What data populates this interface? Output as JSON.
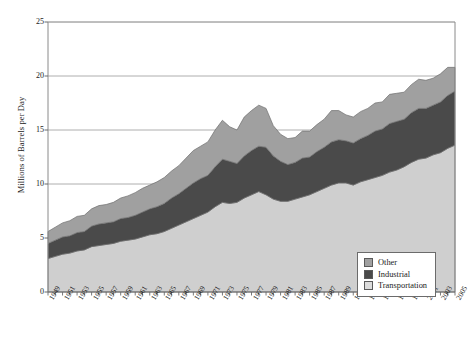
{
  "chart_data": {
    "type": "area",
    "stacked": true,
    "title": "",
    "xlabel": "",
    "ylabel": "Millions of Barrels per Day",
    "ylim": [
      0,
      25
    ],
    "yticks": [
      0,
      5,
      10,
      15,
      20,
      25
    ],
    "xlim": [
      1949,
      2005
    ],
    "grid": true,
    "legend_position": "bottom-right",
    "legend_entries": [
      "Other",
      "Industrial",
      "Transportation"
    ],
    "x": [
      1949,
      1950,
      1951,
      1952,
      1953,
      1954,
      1955,
      1956,
      1957,
      1958,
      1959,
      1960,
      1961,
      1962,
      1963,
      1964,
      1965,
      1966,
      1967,
      1968,
      1969,
      1970,
      1971,
      1972,
      1973,
      1974,
      1975,
      1976,
      1977,
      1978,
      1979,
      1980,
      1981,
      1982,
      1983,
      1984,
      1985,
      1986,
      1987,
      1988,
      1989,
      1990,
      1991,
      1992,
      1993,
      1994,
      1995,
      1996,
      1997,
      1998,
      1999,
      2000,
      2001,
      2002,
      2003,
      2004,
      2005
    ],
    "xtick_labels": [
      "1949",
      "1951",
      "1953",
      "1955",
      "1957",
      "1959",
      "1961",
      "1963",
      "1965",
      "1967",
      "1969",
      "1971",
      "1973",
      "1975",
      "1977",
      "1979",
      "1981",
      "1983",
      "1985",
      "1987",
      "1989",
      "1991",
      "1993",
      "1995",
      "1997",
      "1999",
      "2001",
      "2003",
      "2005"
    ],
    "series": [
      {
        "name": "Transportation",
        "color": "#cfcfcf",
        "values": [
          3.1,
          3.3,
          3.5,
          3.6,
          3.8,
          3.9,
          4.2,
          4.3,
          4.4,
          4.5,
          4.7,
          4.8,
          4.9,
          5.1,
          5.3,
          5.4,
          5.6,
          5.9,
          6.2,
          6.5,
          6.8,
          7.1,
          7.4,
          7.9,
          8.3,
          8.2,
          8.3,
          8.7,
          9.0,
          9.3,
          9.0,
          8.6,
          8.4,
          8.4,
          8.6,
          8.8,
          9.0,
          9.3,
          9.6,
          9.9,
          10.1,
          10.1,
          9.9,
          10.2,
          10.4,
          10.6,
          10.8,
          11.1,
          11.3,
          11.6,
          12.0,
          12.3,
          12.4,
          12.7,
          12.9,
          13.3,
          13.6
        ]
      },
      {
        "name": "Industrial",
        "color": "#4a4a4a",
        "values": [
          1.4,
          1.5,
          1.6,
          1.6,
          1.7,
          1.7,
          1.9,
          2.0,
          2.0,
          2.0,
          2.1,
          2.1,
          2.2,
          2.3,
          2.4,
          2.5,
          2.6,
          2.8,
          2.9,
          3.1,
          3.3,
          3.4,
          3.4,
          3.7,
          4.0,
          3.9,
          3.6,
          3.9,
          4.1,
          4.2,
          4.4,
          4.0,
          3.7,
          3.4,
          3.4,
          3.6,
          3.5,
          3.7,
          3.8,
          4.0,
          4.0,
          3.9,
          3.9,
          4.0,
          4.1,
          4.3,
          4.3,
          4.5,
          4.5,
          4.4,
          4.6,
          4.7,
          4.6,
          4.6,
          4.7,
          4.9,
          5.0
        ]
      },
      {
        "name": "Other",
        "color": "#a0a0a0",
        "values": [
          1.1,
          1.2,
          1.3,
          1.4,
          1.5,
          1.5,
          1.6,
          1.7,
          1.7,
          1.8,
          1.9,
          2.0,
          2.1,
          2.2,
          2.2,
          2.3,
          2.4,
          2.5,
          2.6,
          2.8,
          3.0,
          3.0,
          3.1,
          3.4,
          3.6,
          3.2,
          3.1,
          3.6,
          3.7,
          3.8,
          3.6,
          2.8,
          2.5,
          2.4,
          2.3,
          2.5,
          2.4,
          2.5,
          2.6,
          2.9,
          2.7,
          2.4,
          2.4,
          2.5,
          2.5,
          2.6,
          2.5,
          2.7,
          2.6,
          2.5,
          2.6,
          2.7,
          2.6,
          2.5,
          2.6,
          2.6,
          2.2
        ]
      }
    ]
  },
  "legend": {
    "items": [
      {
        "label": "Other",
        "color": "#a0a0a0"
      },
      {
        "label": "Industrial",
        "color": "#4a4a4a"
      },
      {
        "label": "Transportation",
        "color": "#dcdcdc"
      }
    ]
  },
  "axis": {
    "y_title": "Millions of Barrels per Day"
  }
}
